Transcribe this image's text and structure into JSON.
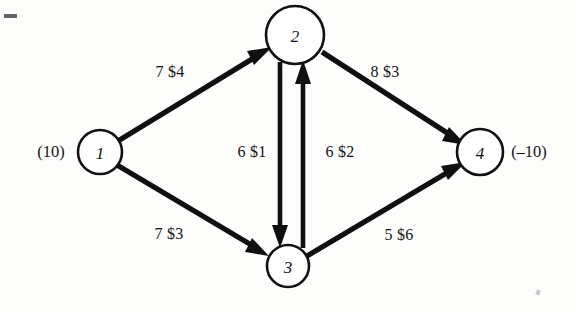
{
  "diagram": {
    "type": "network-flow-graph",
    "title": "",
    "background_color": "#fdfdfc",
    "ink_color": "#101010",
    "nodes": [
      {
        "id": "1",
        "label": "1",
        "x": 100,
        "y": 152,
        "r": 22,
        "annotation": "(10)",
        "annotation_x": 51,
        "annotation_y": 152
      },
      {
        "id": "2",
        "label": "2",
        "x": 295,
        "y": 35,
        "r": 29,
        "annotation": "",
        "annotation_x": 0,
        "annotation_y": 0
      },
      {
        "id": "3",
        "label": "3",
        "x": 288,
        "y": 266,
        "r": 21,
        "annotation": "",
        "annotation_x": 0,
        "annotation_y": 0
      },
      {
        "id": "4",
        "label": "4",
        "x": 480,
        "y": 152,
        "r": 23,
        "annotation": "(–10)",
        "annotation_x": 529,
        "annotation_y": 152
      }
    ],
    "arcs": [
      {
        "from": "1",
        "to": "2",
        "label": "7 $4",
        "label_x": 170,
        "label_y": 72,
        "capacity": 7,
        "cost": 4
      },
      {
        "from": "1",
        "to": "3",
        "label": "7 $3",
        "label_x": 169,
        "label_y": 234,
        "capacity": 7,
        "cost": 3
      },
      {
        "from": "2",
        "to": "4",
        "label": "8 $3",
        "label_x": 385,
        "label_y": 72,
        "capacity": 8,
        "cost": 3
      },
      {
        "from": "3",
        "to": "4",
        "label": "5 $6",
        "label_x": 399,
        "label_y": 235,
        "capacity": 5,
        "cost": 6
      },
      {
        "from": "2",
        "to": "3",
        "label": "6 $1",
        "label_x": 252,
        "label_y": 152,
        "capacity": 6,
        "cost": 1
      },
      {
        "from": "3",
        "to": "2",
        "label": "6 $2",
        "label_x": 340,
        "label_y": 152,
        "capacity": 6,
        "cost": 2
      }
    ]
  }
}
